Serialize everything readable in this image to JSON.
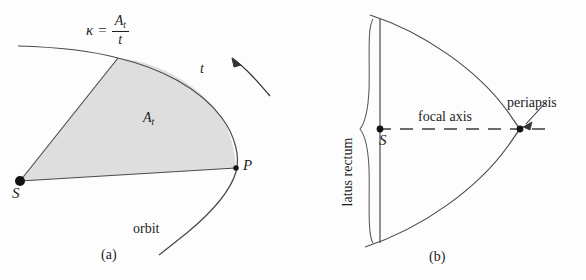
{
  "figure": {
    "background_color": "#fdfdfd",
    "ink_color": "#1d1d1d",
    "shaded_area_color": "#dedede",
    "panels": [
      {
        "id": "a",
        "caption": "(a)",
        "formula": {
          "lhs": "κ",
          "equals": "=",
          "numerator": "A",
          "numerator_subscript": "t",
          "denominator": "t"
        },
        "labels": {
          "swept_area": "A",
          "swept_area_subscript": "t",
          "time": "t",
          "focus_point": "S",
          "orbiting_point": "P",
          "curve": "orbit"
        }
      },
      {
        "id": "b",
        "caption": "(b)",
        "labels": {
          "latus_rectum": "latus rectum",
          "focal_axis": "focal axis",
          "periapsis": "periapsis",
          "focus_point": "S"
        }
      }
    ]
  }
}
